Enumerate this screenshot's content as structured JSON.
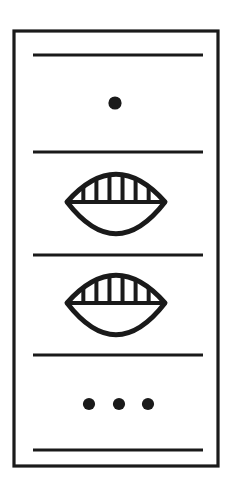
{
  "figure": {
    "title": "Framed panel line drawing",
    "description": "Rectangular outlined panel divided by five horizontal rules into four registers containing a single dot, two striped lens (eye) symbols and a row of three dots.",
    "background_color": "#ffffff",
    "ink_color": "#1a1a1a",
    "canvas": {
      "width": 249,
      "height": 481
    }
  },
  "frame": {
    "name": "outer-rectangle",
    "x": 14,
    "y": 31,
    "width": 204,
    "height": 435,
    "stroke_width": 3.2,
    "stroke_color": "#1a1a1a",
    "fill": "none"
  },
  "dividers": {
    "count": 5,
    "x_start": 33,
    "x_end": 203,
    "stroke_width": 3.0,
    "stroke_color": "#1a1a1a",
    "y_positions": [
      55,
      152,
      255,
      355,
      450
    ],
    "labels": [
      "divider-line-1",
      "divider-line-2",
      "divider-line-3",
      "divider-line-4",
      "divider-line-5"
    ]
  },
  "registers": [
    {
      "name": "register-single-dot",
      "index": 1,
      "content_type": "dot",
      "dot_count": 1,
      "dots": [
        {
          "cx": 115,
          "cy": 103,
          "r": 6.6
        }
      ],
      "fill": "#1a1a1a"
    },
    {
      "name": "register-eye-upper",
      "index": 2,
      "content_type": "striped-lens",
      "center_x": 116,
      "center_y": 202,
      "half_width": 49,
      "half_height": 27,
      "stripe_count": 6,
      "stroke_width": 5.0,
      "fill": "none"
    },
    {
      "name": "register-eye-lower",
      "index": 3,
      "content_type": "striped-lens",
      "center_x": 116,
      "center_y": 303,
      "half_width": 49,
      "half_height": 27,
      "stripe_count": 6,
      "stroke_width": 5.0,
      "fill": "none"
    },
    {
      "name": "register-triple-dots",
      "index": 4,
      "content_type": "dot",
      "dot_count": 3,
      "dots": [
        {
          "cx": 89,
          "cy": 404,
          "r": 6.1
        },
        {
          "cx": 119,
          "cy": 404,
          "r": 6.1
        },
        {
          "cx": 148,
          "cy": 404,
          "r": 6.1
        }
      ],
      "fill": "#1a1a1a"
    }
  ],
  "symbols": {
    "lens_label": "striped-lens-symbol",
    "dot_label": "filled-dot",
    "stripe_label": "lens-stripe"
  }
}
